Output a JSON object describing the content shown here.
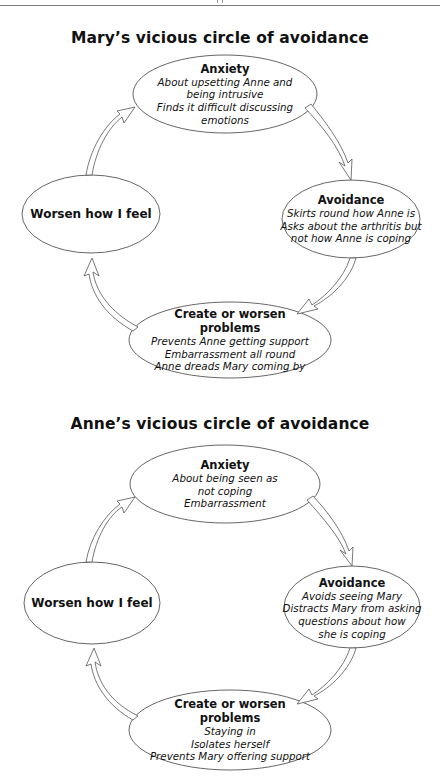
{
  "header": {
    "rule": true
  },
  "diagrams": [
    {
      "title": "Mary’s vicious circle of avoidance",
      "nodes": {
        "anxiety": {
          "heading": "Anxiety",
          "lines": [
            "About upsetting Anne and",
            "being intrusive",
            "Finds it difficult discussing",
            "emotions"
          ]
        },
        "avoidance": {
          "heading": "Avoidance",
          "lines": [
            "Skirts round how Anne is",
            "Asks about the arthritis but",
            "not how Anne is coping"
          ]
        },
        "create": {
          "heading_lines": [
            "Create or worsen",
            "problems"
          ],
          "lines": [
            "Prevents Anne getting support",
            "Embarrassment all round",
            "Anne dreads Mary coming by"
          ]
        },
        "worsen": {
          "heading": "Worsen how I feel",
          "lines": []
        }
      },
      "flow": [
        "anxiety",
        "avoidance",
        "create",
        "worsen",
        "anxiety"
      ]
    },
    {
      "title": "Anne’s vicious circle of avoidance",
      "nodes": {
        "anxiety": {
          "heading": "Anxiety",
          "lines": [
            "About being seen as",
            "not coping",
            "Embarrassment"
          ]
        },
        "avoidance": {
          "heading": "Avoidance",
          "lines": [
            "Avoids seeing Mary",
            "Distracts Mary from asking",
            "questions about how",
            "she is coping"
          ]
        },
        "create": {
          "heading_lines": [
            "Create or worsen",
            "problems"
          ],
          "lines": [
            "Staying in",
            "Isolates herself",
            "Prevents Mary offering support"
          ]
        },
        "worsen": {
          "heading": "Worsen how I feel",
          "lines": []
        }
      },
      "flow": [
        "anxiety",
        "avoidance",
        "create",
        "worsen",
        "anxiety"
      ]
    }
  ],
  "colors": {
    "stroke": "#555555",
    "text": "#111111",
    "background": "#ffffff"
  }
}
